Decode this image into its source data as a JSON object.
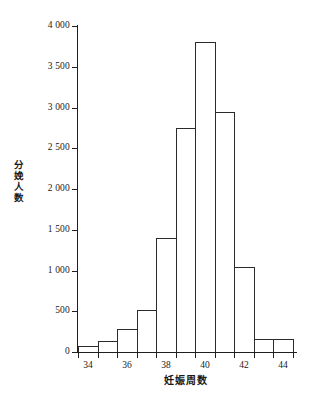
{
  "chart_data": {
    "type": "bar",
    "title": "",
    "subtitle": "",
    "xlabel": "妊娠周数",
    "ylabel": "分娩人数",
    "xlim": [
      33.5,
      44.5
    ],
    "ylim": [
      0,
      4000
    ],
    "grid": false,
    "legend": null,
    "bin_width": 1,
    "x_tick_labels": [
      "34",
      "36",
      "38",
      "40",
      "42",
      "44"
    ],
    "x_tick_values": [
      34,
      36,
      38,
      40,
      42,
      44
    ],
    "y_tick_labels": [
      "0",
      "500",
      "1 000",
      "1 500",
      "2 000",
      "2 500",
      "3 000",
      "3 500",
      "4 000"
    ],
    "y_tick_values": [
      0,
      500,
      1000,
      1500,
      2000,
      2500,
      3000,
      3500,
      4000
    ],
    "categories": [
      "34",
      "35",
      "36",
      "37",
      "38",
      "39",
      "40",
      "41",
      "42",
      "43",
      "44"
    ],
    "bin_edges": [
      33.5,
      34.5,
      35.5,
      36.5,
      37.5,
      38.5,
      39.5,
      40.5,
      41.5,
      42.5,
      43.5,
      44.5
    ],
    "values": [
      75,
      130,
      285,
      520,
      1400,
      2750,
      3800,
      2940,
      1040,
      165,
      165
    ],
    "bar_color": "#ffffff",
    "bar_edge_color": "#2b2b2b",
    "axis_color": "#1f1f1f"
  }
}
